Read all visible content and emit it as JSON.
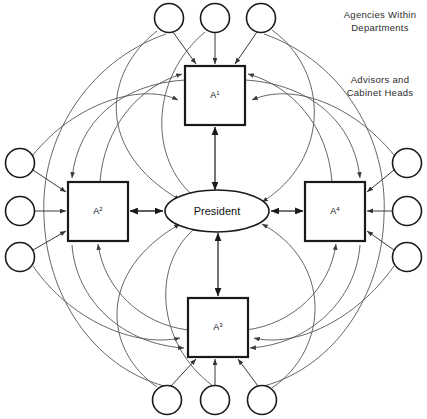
{
  "diagram": {
    "type": "organizational-network-diagram",
    "center": {
      "id": "president",
      "label": "President",
      "shape": "ellipse",
      "cx": 217,
      "cy": 211,
      "rx": 52,
      "ry": 21
    },
    "boxes": [
      {
        "id": "box-a1",
        "label": "A",
        "superscript": "1",
        "shape": "square",
        "x": 185,
        "y": 66,
        "w": 60,
        "h": 59,
        "position": "top"
      },
      {
        "id": "box-a2",
        "label": "A",
        "superscript": "2",
        "shape": "square",
        "x": 68,
        "y": 182,
        "w": 60,
        "h": 59,
        "position": "left"
      },
      {
        "id": "box-a3",
        "label": "A",
        "superscript": "3",
        "shape": "square",
        "x": 188,
        "y": 298,
        "w": 60,
        "h": 59,
        "position": "bottom"
      },
      {
        "id": "box-a4",
        "label": "A",
        "superscript": "4",
        "shape": "square",
        "x": 305,
        "y": 182,
        "w": 60,
        "h": 59,
        "position": "right"
      }
    ],
    "circles": [
      {
        "id": "circle-top-1",
        "cx": 169,
        "cy": 18,
        "r": 14.5,
        "group": "top"
      },
      {
        "id": "circle-top-2",
        "cx": 215,
        "cy": 18,
        "r": 14.5,
        "group": "top"
      },
      {
        "id": "circle-top-3",
        "cx": 261,
        "cy": 18,
        "r": 14.5,
        "group": "top"
      },
      {
        "id": "circle-left-1",
        "cx": 20,
        "cy": 163,
        "r": 14.5,
        "group": "left"
      },
      {
        "id": "circle-left-2",
        "cx": 20,
        "cy": 211,
        "r": 14.5,
        "group": "left"
      },
      {
        "id": "circle-left-3",
        "cx": 20,
        "cy": 257,
        "r": 14.5,
        "group": "left"
      },
      {
        "id": "circle-right-1",
        "cx": 407,
        "cy": 163,
        "r": 14.5,
        "group": "right"
      },
      {
        "id": "circle-right-2",
        "cx": 407,
        "cy": 211,
        "r": 14.5,
        "group": "right"
      },
      {
        "id": "circle-right-3",
        "cx": 407,
        "cy": 257,
        "r": 14.5,
        "group": "right"
      },
      {
        "id": "circle-bottom-1",
        "cx": 167,
        "cy": 400,
        "r": 14.5,
        "group": "bottom"
      },
      {
        "id": "circle-bottom-2",
        "cx": 215,
        "cy": 400,
        "r": 14.5,
        "group": "bottom"
      },
      {
        "id": "circle-bottom-3",
        "cx": 262,
        "cy": 400,
        "r": 14.5,
        "group": "bottom"
      }
    ],
    "captions": [
      {
        "id": "caption-agencies",
        "line1": "Agencies Within",
        "line2": "Departments",
        "x": 380,
        "y": 16
      },
      {
        "id": "caption-advisors",
        "line1": "Advisors and",
        "line2": "Cabinet Heads",
        "x": 380,
        "y": 81
      }
    ],
    "colors": {
      "background": "#ffffff",
      "stroke": "#1a1a1a",
      "arc_stroke": "#555555",
      "text": "#111111",
      "caption_text": "#2b2b2b"
    }
  }
}
